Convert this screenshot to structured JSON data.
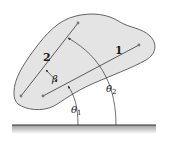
{
  "diagram": {
    "colors": {
      "body_fill": "#e4e4e4",
      "body_stroke": "#555555",
      "line_color": "#5a5a5a",
      "point_color": "#777777",
      "ground_color": "#333333",
      "text_color": "#1a1a1a"
    },
    "lines": [
      {
        "label": "1",
        "start": [
          43,
          96
        ],
        "end": [
          139,
          45
        ]
      },
      {
        "label": "2",
        "start": [
          21,
          96
        ],
        "end": [
          78,
          23
        ]
      }
    ],
    "angles": {
      "beta": {
        "label": "β"
      },
      "theta1": {
        "label": "θ",
        "subscript": "1"
      },
      "theta2": {
        "label": "θ",
        "subscript": "2"
      }
    },
    "ground": {
      "x_start": 12,
      "x_end": 156,
      "y": 125
    }
  }
}
